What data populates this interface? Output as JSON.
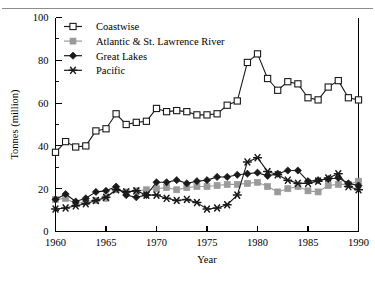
{
  "chart_data": {
    "type": "line",
    "title": "",
    "xlabel": "Year",
    "ylabel": "Tonnes (million)",
    "xlim": [
      1960,
      1990
    ],
    "ylim": [
      0,
      100
    ],
    "xticks": [
      1960,
      1965,
      1970,
      1975,
      1980,
      1985,
      1990
    ],
    "yticks": [
      0,
      20,
      40,
      60,
      80,
      100
    ],
    "yticks_minor": [
      10,
      30,
      50,
      70,
      90
    ],
    "grid": false,
    "legend_position": "top-left",
    "x": [
      1960,
      1961,
      1962,
      1963,
      1964,
      1965,
      1966,
      1967,
      1968,
      1969,
      1970,
      1971,
      1972,
      1973,
      1974,
      1975,
      1976,
      1977,
      1978,
      1979,
      1980,
      1981,
      1982,
      1983,
      1984,
      1985,
      1986,
      1987,
      1988,
      1989,
      1990
    ],
    "series": [
      {
        "name": "Coastwise",
        "marker": "open-square",
        "color": "#1a1a1a",
        "fill": "#ffffff",
        "values": [
          37.0,
          42.0,
          39.5,
          40.0,
          47.0,
          48.0,
          55.0,
          50.0,
          51.0,
          51.5,
          57.5,
          56.0,
          56.5,
          56.0,
          54.5,
          54.5,
          55.0,
          59.0,
          61.0,
          79.0,
          83.0,
          71.5,
          66.0,
          70.0,
          69.0,
          62.5,
          61.5,
          67.5,
          70.5,
          62.5,
          61.5
        ]
      },
      {
        "name": "Atlantic & St. Lawrence River",
        "marker": "filled-square",
        "color": "#9a9a9a",
        "fill": "#9a9a9a",
        "values": [
          15.0,
          15.5,
          13.0,
          14.0,
          14.5,
          15.5,
          19.5,
          18.5,
          19.0,
          19.5,
          20.0,
          20.5,
          19.5,
          20.5,
          21.0,
          21.0,
          21.5,
          22.0,
          22.0,
          22.5,
          23.0,
          21.0,
          18.5,
          20.0,
          21.0,
          19.0,
          18.5,
          21.5,
          22.0,
          22.0,
          23.5
        ]
      },
      {
        "name": "Great Lakes",
        "marker": "diamond",
        "color": "#1a1a1a",
        "fill": "#1a1a1a",
        "values": [
          15.0,
          17.5,
          14.0,
          15.5,
          18.5,
          19.0,
          21.0,
          17.0,
          16.0,
          17.0,
          23.0,
          23.0,
          24.0,
          22.5,
          23.5,
          24.0,
          25.5,
          25.5,
          26.5,
          27.0,
          27.5,
          26.0,
          27.0,
          28.5,
          28.5,
          23.5,
          24.0,
          24.5,
          25.0,
          22.5,
          21.5
        ]
      },
      {
        "name": "Pacific",
        "marker": "star-x",
        "color": "#1a1a1a",
        "fill": "#1a1a1a",
        "values": [
          10.5,
          11.0,
          12.0,
          13.0,
          14.5,
          16.0,
          19.5,
          18.5,
          19.0,
          17.0,
          17.0,
          15.5,
          14.5,
          15.0,
          13.5,
          10.5,
          11.0,
          12.5,
          17.0,
          32.5,
          34.5,
          28.0,
          26.5,
          24.0,
          22.5,
          22.5,
          23.5,
          25.0,
          27.0,
          21.0,
          19.5
        ]
      }
    ]
  },
  "legend": {
    "items": [
      {
        "label": "Coastwise"
      },
      {
        "label": "Atlantic & St. Lawrence River"
      },
      {
        "label": "Great Lakes"
      },
      {
        "label": "Pacific"
      }
    ]
  },
  "axes": {
    "x_title": "Year",
    "y_title": "Tonnes (million)",
    "x_tick_labels": [
      "1960",
      "1965",
      "1970",
      "1975",
      "1980",
      "1985",
      "1990"
    ],
    "y_tick_labels": [
      "0",
      "20",
      "40",
      "60",
      "80",
      "100"
    ]
  }
}
